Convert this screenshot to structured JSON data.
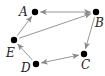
{
  "diagram": {
    "type": "directed-graph",
    "colors": {
      "edge": "#8a8a8a",
      "node": "#000000",
      "label": "#222222",
      "background": "#ffffff"
    },
    "nodes": [
      {
        "id": "A",
        "label": "A",
        "x": 35,
        "y": 12,
        "lx": 19,
        "ly": 16
      },
      {
        "id": "B",
        "label": "B",
        "x": 96,
        "y": 12,
        "lx": 95,
        "ly": 27
      },
      {
        "id": "C",
        "label": "C",
        "x": 84,
        "y": 54,
        "lx": 81,
        "ly": 69
      },
      {
        "id": "D",
        "label": "D",
        "x": 36,
        "y": 64,
        "lx": 21,
        "ly": 72
      },
      {
        "id": "E",
        "label": "E",
        "x": 14,
        "y": 40,
        "lx": 6,
        "ly": 57
      }
    ],
    "edges": [
      {
        "from": "A",
        "to": "B",
        "bidirectional": true
      },
      {
        "from": "E",
        "to": "A",
        "bidirectional": false
      },
      {
        "from": "E",
        "to": "B",
        "bidirectional": false
      },
      {
        "from": "B",
        "to": "C",
        "bidirectional": false
      },
      {
        "from": "D",
        "to": "C",
        "bidirectional": true
      },
      {
        "from": "D",
        "to": "E",
        "bidirectional": false
      }
    ]
  }
}
